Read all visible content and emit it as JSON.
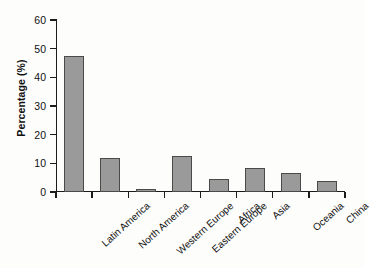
{
  "chart_data": {
    "type": "bar",
    "title": "",
    "xlabel": "",
    "ylabel": "Percentage (%)",
    "ylim": [
      0,
      60
    ],
    "yticks": [
      0,
      10,
      20,
      30,
      40,
      50,
      60
    ],
    "grid": false,
    "legend": null,
    "bar_color": "#9a9a9a",
    "bar_edge_color": "#4a4a4a",
    "axis_color": "#1b1b1b",
    "background": "#fdfdfc",
    "categories": [
      "Latin America",
      "North America",
      "Western Europe",
      "Eastern Europe",
      "Africa",
      "Asia",
      "Oceania",
      "China"
    ],
    "values": [
      47.5,
      12.0,
      1.0,
      12.5,
      4.5,
      8.5,
      6.5,
      4.0
    ]
  }
}
